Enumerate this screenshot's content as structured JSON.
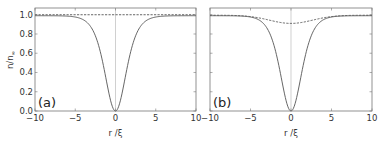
{
  "chart_data": [
    {
      "panel": "(a)",
      "type": "line",
      "xlabel": "r /ξ",
      "ylabel": "n/n∞",
      "xlim": [
        -10,
        10
      ],
      "ylim": [
        0,
        1.07
      ],
      "xticks": [
        -10,
        -5,
        0,
        5,
        10
      ],
      "yticks": [
        0.0,
        0.2,
        0.4,
        0.6,
        0.8,
        1.0
      ],
      "vertical_reference_line": 0,
      "grid": false,
      "series": [
        {
          "name": "solid",
          "style": "solid",
          "x": [
            -10,
            -8,
            -6,
            -5,
            -4,
            -3,
            -2,
            -1.5,
            -1,
            -0.5,
            0,
            0.5,
            1,
            1.5,
            2,
            3,
            4,
            5,
            6,
            8,
            10
          ],
          "y": [
            0.98,
            0.97,
            0.95,
            0.93,
            0.89,
            0.81,
            0.65,
            0.53,
            0.33,
            0.11,
            0.0,
            0.11,
            0.33,
            0.53,
            0.65,
            0.81,
            0.89,
            0.93,
            0.95,
            0.97,
            0.98
          ]
        },
        {
          "name": "dashed",
          "style": "dashed",
          "x": [
            -10,
            0,
            10
          ],
          "y": [
            1.0,
            1.0,
            1.0
          ]
        }
      ]
    },
    {
      "panel": "(b)",
      "type": "line",
      "xlabel": "r /ξ",
      "ylabel": "",
      "xlim": [
        -10,
        10
      ],
      "ylim": [
        0,
        1.07
      ],
      "xticks": [
        -10,
        -5,
        0,
        5,
        10
      ],
      "yticks": [
        0.0,
        0.2,
        0.4,
        0.6,
        0.8,
        1.0
      ],
      "vertical_reference_line": 0,
      "grid": false,
      "series": [
        {
          "name": "solid",
          "style": "solid",
          "x": [
            -10,
            -8,
            -6,
            -5,
            -4,
            -3,
            -2,
            -1.5,
            -1,
            -0.5,
            0,
            0.5,
            1,
            1.5,
            2,
            3,
            4,
            5,
            6,
            8,
            10
          ],
          "y": [
            0.98,
            0.97,
            0.95,
            0.93,
            0.89,
            0.81,
            0.65,
            0.53,
            0.33,
            0.11,
            0.0,
            0.11,
            0.33,
            0.53,
            0.65,
            0.81,
            0.89,
            0.93,
            0.95,
            0.97,
            0.98
          ]
        },
        {
          "name": "dashed",
          "style": "dashed",
          "x": [
            -10,
            -8,
            -6,
            -4,
            -2,
            0,
            2,
            4,
            6,
            8,
            10
          ],
          "y": [
            0.99,
            0.985,
            0.97,
            0.945,
            0.92,
            0.91,
            0.92,
            0.945,
            0.97,
            0.985,
            0.99
          ]
        }
      ]
    }
  ],
  "labels": {
    "ylabel_main": "n/n",
    "ylabel_sub": "∞",
    "xlabel": "r /ξ",
    "panel_a": "(a)",
    "panel_b": "(b)",
    "yticks": [
      "0.0",
      "0.2",
      "0.4",
      "0.6",
      "0.8",
      "1.0"
    ],
    "xticks": [
      "−10",
      "−5",
      "0",
      "5",
      "10"
    ]
  },
  "colors": {
    "curve": "#555555",
    "frame": "#777777",
    "zero_line": "#bbbbbb"
  }
}
